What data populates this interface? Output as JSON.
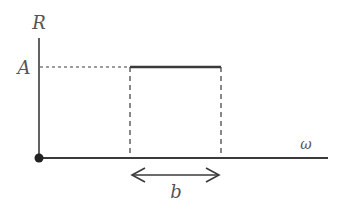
{
  "diagram": {
    "type": "rectangular-pulse",
    "axes": {
      "y_label": "R",
      "x_label": "ω"
    },
    "amplitude_label": "A",
    "width_label": "b",
    "colors": {
      "line": "#3a3a3a",
      "text": "#555555",
      "background": "#ffffff"
    }
  }
}
